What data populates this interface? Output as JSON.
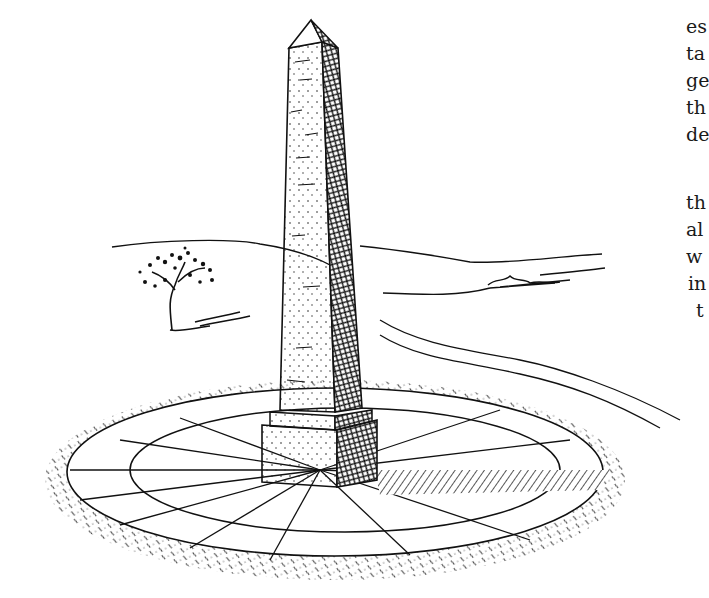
{
  "illustration": {
    "subject": "obelisk-monument-on-circular-paved-base",
    "style": "pen-and-ink line drawing",
    "ink_color": "#111111",
    "paper_color": "#ffffff"
  },
  "text_fragments": {
    "block1": [
      {
        "text": "es",
        "x": 686,
        "y": 17
      },
      {
        "text": "ta",
        "x": 686,
        "y": 44
      },
      {
        "text": "ge",
        "x": 686,
        "y": 71
      },
      {
        "text": "th",
        "x": 686,
        "y": 98
      },
      {
        "text": "de",
        "x": 686,
        "y": 125
      }
    ],
    "block2": [
      {
        "text": "th",
        "x": 686,
        "y": 193
      },
      {
        "text": "al",
        "x": 686,
        "y": 220
      },
      {
        "text": "w",
        "x": 686,
        "y": 247
      },
      {
        "text": "in",
        "x": 688,
        "y": 274
      },
      {
        "text": "t",
        "x": 696,
        "y": 301
      }
    ]
  }
}
